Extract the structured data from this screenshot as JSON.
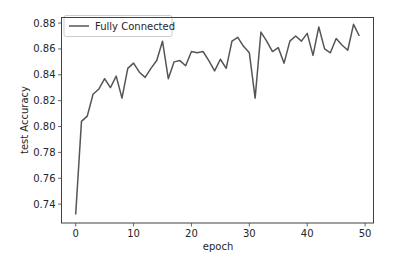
{
  "chart_data": {
    "type": "line",
    "title": "",
    "xlabel": "epoch",
    "ylabel": "test Accuracy",
    "xlim": [
      -2.45,
      51.45
    ],
    "ylim": [
      0.7254,
      0.8843
    ],
    "xticks": [
      0,
      10,
      20,
      30,
      40,
      50
    ],
    "xtick_labels": [
      "0",
      "10",
      "20",
      "30",
      "40",
      "50"
    ],
    "yticks": [
      0.74,
      0.76,
      0.78,
      0.8,
      0.82,
      0.84,
      0.86,
      0.88
    ],
    "ytick_labels": [
      "0.74",
      "0.76",
      "0.78",
      "0.80",
      "0.82",
      "0.84",
      "0.86",
      "0.88"
    ],
    "grid": false,
    "legend_position": "upper left",
    "series": [
      {
        "name": "Fully Connected",
        "color": "#555555",
        "x": [
          0,
          1,
          2,
          3,
          4,
          5,
          6,
          7,
          8,
          9,
          10,
          11,
          12,
          13,
          14,
          15,
          16,
          17,
          18,
          19,
          20,
          21,
          22,
          23,
          24,
          25,
          26,
          27,
          28,
          29,
          30,
          31,
          32,
          33,
          34,
          35,
          36,
          37,
          38,
          39,
          40,
          41,
          42,
          43,
          44,
          45,
          46,
          47,
          48,
          49
        ],
        "values": [
          0.732,
          0.804,
          0.808,
          0.825,
          0.829,
          0.837,
          0.83,
          0.839,
          0.822,
          0.845,
          0.849,
          0.842,
          0.838,
          0.845,
          0.851,
          0.866,
          0.837,
          0.85,
          0.851,
          0.847,
          0.858,
          0.857,
          0.858,
          0.851,
          0.843,
          0.852,
          0.845,
          0.866,
          0.869,
          0.862,
          0.857,
          0.822,
          0.873,
          0.866,
          0.858,
          0.861,
          0.849,
          0.866,
          0.87,
          0.866,
          0.872,
          0.855,
          0.877,
          0.86,
          0.857,
          0.868,
          0.863,
          0.859,
          0.879,
          0.87
        ]
      }
    ]
  },
  "colors": {
    "line": "#555555",
    "axes": "#404040",
    "text": "#262626",
    "legend_border": "#cccccc",
    "background": "#ffffff"
  }
}
